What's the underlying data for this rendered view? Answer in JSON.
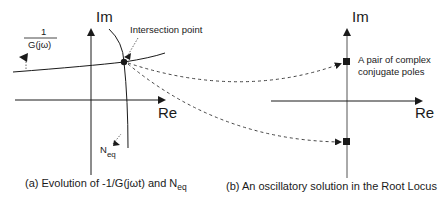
{
  "panels": {
    "left": {
      "im_label": "Im",
      "re_label": "Re",
      "fraction_numerator": "1",
      "fraction_denominator": "G(jω)",
      "intersection_label": "Intersection point",
      "neq_label_main": "N",
      "neq_label_sub": "eq",
      "caption_main": "(a) Evolution of -1/G(jωt) and N",
      "caption_sub": "eq"
    },
    "right": {
      "im_label": "Im",
      "re_label": "Re",
      "poles_label_line1": "A pair of complex",
      "poles_label_line2": "conjugate poles",
      "caption": "(b) An oscillatory solution in the Root Locus"
    }
  },
  "colors": {
    "stroke": "#1a1a1a",
    "dashed": "#444444",
    "background": "#ffffff"
  }
}
